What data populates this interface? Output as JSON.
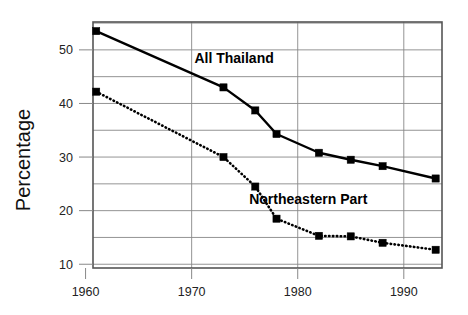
{
  "chart_data": {
    "type": "line",
    "title": "",
    "subtitle": "",
    "xlabel": "",
    "ylabel": "Percentage",
    "xlim": [
      1960.7,
      1993.6
    ],
    "ylim": [
      9.3,
      55.2
    ],
    "grid": true,
    "grid_detail": "horizontal gridlines every 5 percentage points; vertical gridlines at each labeled decade",
    "legend": "inline annotations next to each curve",
    "x_ticks": [
      1960,
      1970,
      1980,
      1990
    ],
    "x_tick_labels": [
      "1960",
      "1970",
      "1980",
      "1990"
    ],
    "y_ticks": [
      10,
      20,
      30,
      40,
      50
    ],
    "y_tick_labels": [
      "10",
      "20",
      "30",
      "40",
      "50"
    ],
    "y_gridlines": [
      10,
      15,
      20,
      25,
      30,
      35,
      40,
      45,
      50,
      55
    ],
    "series": [
      {
        "name": "All Thailand",
        "style": "solid",
        "marker": "square",
        "color": "#000000",
        "x": [
          1961,
          1973,
          1976,
          1978,
          1982,
          1985,
          1988,
          1993
        ],
        "values": [
          53.5,
          43.0,
          38.7,
          34.3,
          30.8,
          29.5,
          28.3,
          26.0
        ],
        "label_x": 1974.0,
        "label_y": 47.5
      },
      {
        "name": "Northeastern Part",
        "style": "dotted",
        "marker": "square",
        "color": "#000000",
        "x": [
          1961,
          1973,
          1976,
          1978,
          1982,
          1985,
          1988,
          1993
        ],
        "values": [
          42.2,
          30.0,
          24.5,
          18.5,
          15.3,
          15.2,
          14.0,
          12.7
        ],
        "label_x": 1981.0,
        "label_y": 21.3
      }
    ],
    "annotations": [
      {
        "text": "All Thailand"
      },
      {
        "text": "Northeastern Part"
      }
    ]
  },
  "axis": {
    "y_title": "Percentage"
  },
  "colors": {
    "plot_border": "#555555",
    "gridline": "#888888",
    "series_line": "#000000",
    "background": "#ffffff",
    "text": "#111111"
  }
}
